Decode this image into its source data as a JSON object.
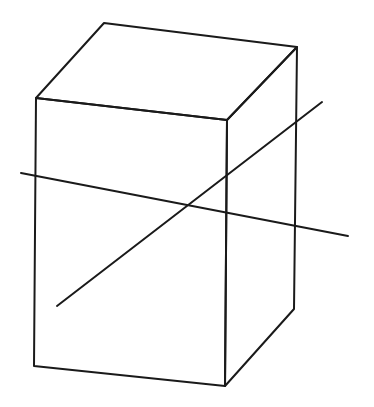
{
  "figure": {
    "top_caption_fragment": "",
    "caption_color": "#c0506a",
    "stroke_color": "#1a1a1a",
    "stroke_width": 2
  },
  "box": {
    "label": "rectangular prism",
    "vertices": {
      "front_top_left": [
        36,
        98
      ],
      "front_top_right": [
        227,
        120
      ],
      "front_bottom_left": [
        34,
        366
      ],
      "front_bottom_right": [
        225,
        386
      ],
      "back_top_left": [
        104,
        23
      ],
      "back_top_right": [
        297,
        47
      ],
      "back_bottom_right": [
        294,
        309
      ]
    }
  },
  "lines": [
    {
      "name": "line-a",
      "from": [
        21,
        173
      ],
      "to": [
        348,
        236
      ]
    },
    {
      "name": "line-b",
      "from": [
        57,
        306
      ],
      "to": [
        322,
        102
      ]
    }
  ],
  "intersection": [
    188,
    205
  ]
}
